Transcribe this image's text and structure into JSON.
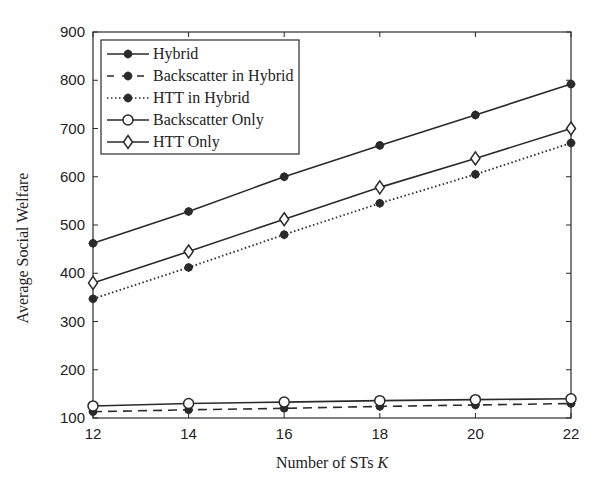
{
  "chart_data": {
    "type": "line",
    "title": "",
    "xlabel": "Number of STs K",
    "xlabel_parts": {
      "text": "Number of STs ",
      "var": "K"
    },
    "ylabel": "Average Social Welfare",
    "x": [
      12,
      14,
      16,
      18,
      20,
      22
    ],
    "xlim": [
      12,
      22
    ],
    "ylim": [
      100,
      900
    ],
    "xticks": [
      12,
      14,
      16,
      18,
      20,
      22
    ],
    "yticks": [
      100,
      200,
      300,
      400,
      500,
      600,
      700,
      800,
      900
    ],
    "grid": false,
    "legend_position": "upper left",
    "series": [
      {
        "name": "Hybrid",
        "line": "solid",
        "marker": "star-filled",
        "values": [
          462,
          528,
          600,
          665,
          728,
          792
        ]
      },
      {
        "name": "Backscatter in Hybrid",
        "line": "dashed",
        "marker": "star-filled",
        "values": [
          113,
          117,
          120,
          124,
          127,
          130
        ]
      },
      {
        "name": "HTT in Hybrid",
        "line": "dotted",
        "marker": "star-filled",
        "values": [
          347,
          412,
          480,
          545,
          605,
          670
        ]
      },
      {
        "name": "Backscatter Only",
        "line": "solid",
        "marker": "circle-open",
        "values": [
          125,
          130,
          133,
          136,
          138,
          140
        ]
      },
      {
        "name": "HTT Only",
        "line": "solid",
        "marker": "diamond-open",
        "values": [
          380,
          445,
          512,
          578,
          638,
          700
        ]
      }
    ]
  }
}
